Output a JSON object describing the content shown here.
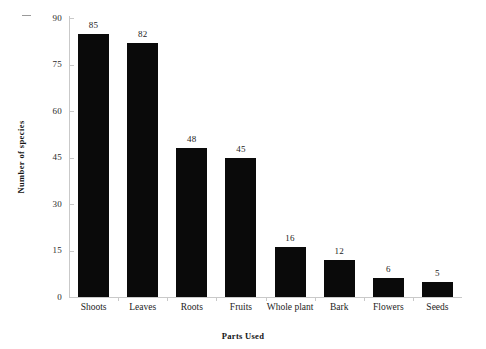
{
  "chart_data": {
    "type": "bar",
    "title": "",
    "xlabel": "Parts Used",
    "ylabel": "Number of species",
    "categories": [
      "Shoots",
      "Leaves",
      "Roots",
      "Fruits",
      "Whole plant",
      "Bark",
      "Flowers",
      "Seeds"
    ],
    "values": [
      85,
      82,
      48,
      45,
      16,
      12,
      6,
      5
    ],
    "value_labels": [
      "85",
      "82",
      "48",
      "45",
      "16",
      "12",
      "6",
      "5"
    ],
    "ylim": [
      0,
      90
    ],
    "yticks": [
      90,
      75,
      60,
      45,
      30,
      15,
      0
    ],
    "ytick_labels": [
      "90",
      "75",
      "60",
      "45",
      "30",
      "15",
      "0"
    ],
    "grid": false,
    "legend": false,
    "legend_position": "none",
    "bar_color": "#0a0a0a",
    "background_color": "#ffffff",
    "axis_color": "#c9c9c9"
  }
}
